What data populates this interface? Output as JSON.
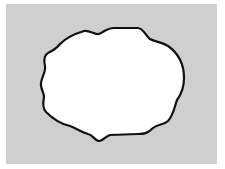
{
  "figure": {
    "background_color": "#cfcfcf",
    "shape_fill": "#ffffff",
    "shape_stroke": "#111111"
  }
}
